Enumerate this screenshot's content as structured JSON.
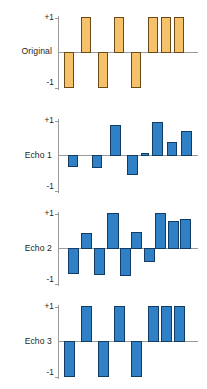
{
  "figure": {
    "background": "#ffffff",
    "orig_fill": "#f5c26b",
    "orig_stroke": "#6b4a18",
    "echo_fill": "#2f80c4",
    "echo_stroke": "#123c63",
    "axis_color": "#9a9a9a",
    "tick_top": "+1",
    "tick_bottom": "-1"
  },
  "chart_data": {
    "type": "bar",
    "title": "",
    "xlabel": "",
    "ylabel": "",
    "ylim": [
      -1,
      1
    ],
    "grid": false,
    "legend": "none",
    "categories": [
      "1",
      "2",
      "3",
      "4",
      "5",
      "6",
      "7",
      "8"
    ],
    "panels": [
      {
        "label": "Original",
        "color": "#f5c26b",
        "tick_top": "+1",
        "tick_bottom": "-1",
        "values": [
          -1,
          1,
          -1,
          1,
          -1,
          1,
          1,
          1
        ]
      },
      {
        "label": "Echo 1",
        "color": "#2f80c4",
        "tick_top": "+1",
        "tick_bottom": "-1",
        "values": [
          -0.3,
          -0.33,
          0.87,
          -0.55,
          0.07,
          0.95,
          0.38,
          0.7
        ]
      },
      {
        "label": "Echo 2",
        "color": "#2f80c4",
        "tick_top": "+1",
        "tick_bottom": "-1",
        "values": [
          -0.72,
          0.42,
          -0.75,
          1.0,
          -0.78,
          0.45,
          -0.37,
          1.0,
          0.78,
          0.82
        ]
      },
      {
        "label": "Echo 3",
        "color": "#2f80c4",
        "tick_top": "+1",
        "tick_bottom": "-1",
        "values": [
          -1,
          1,
          -1,
          1,
          -1,
          1,
          1,
          1
        ]
      }
    ]
  }
}
